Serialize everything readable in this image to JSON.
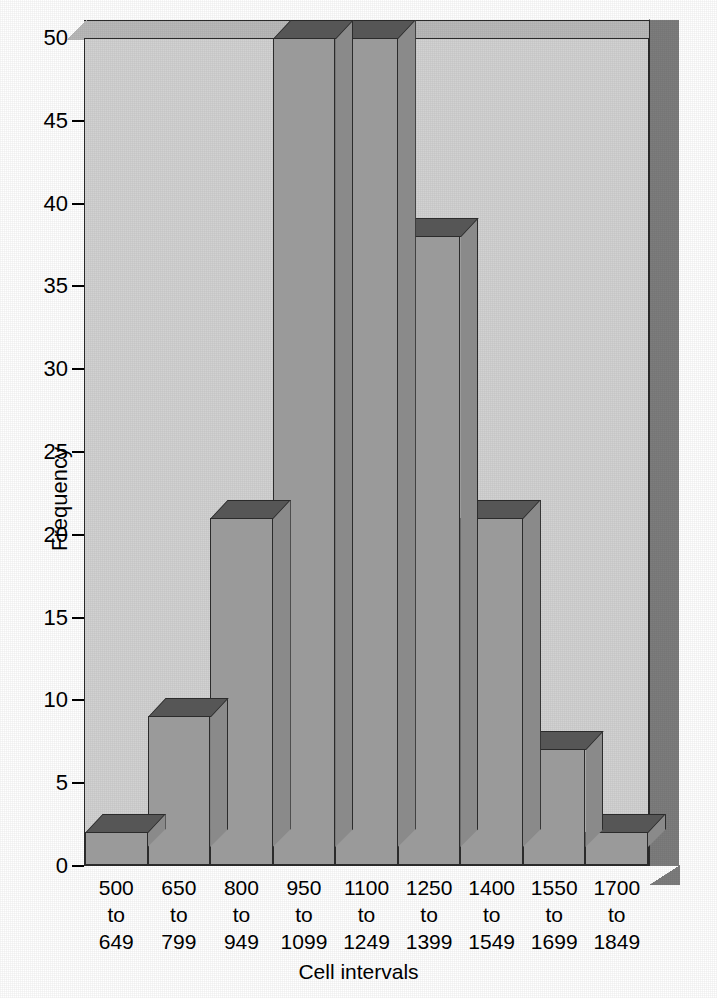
{
  "chart_data": {
    "type": "bar",
    "title": "",
    "xlabel": "Cell intervals",
    "ylabel": "Frequency",
    "categories": [
      "500\nto\n649",
      "650\nto\n799",
      "800\nto\n949",
      "950\nto\n1099",
      "1100\nto\n1249",
      "1250\nto\n1399",
      "1400\nto\n1549",
      "1550\nto\n1699",
      "1700\nto\n1849"
    ],
    "category_lines": [
      [
        "500",
        "to",
        "649"
      ],
      [
        "650",
        "to",
        "799"
      ],
      [
        "800",
        "to",
        "949"
      ],
      [
        "950",
        "to",
        "1099"
      ],
      [
        "1100",
        "to",
        "1249"
      ],
      [
        "1250",
        "to",
        "1399"
      ],
      [
        "1400",
        "to",
        "1549"
      ],
      [
        "1550",
        "to",
        "1699"
      ],
      [
        "1700",
        "to",
        "1849"
      ]
    ],
    "values": [
      2,
      9,
      21,
      50,
      50,
      38,
      21,
      7,
      2
    ],
    "ylim": [
      0,
      50
    ],
    "yticks": [
      0,
      5,
      10,
      15,
      20,
      25,
      30,
      35,
      40,
      45,
      50
    ],
    "ytick_labels": [
      "0",
      "5",
      "10",
      "15",
      "20",
      "25",
      "30",
      "35",
      "40",
      "45",
      "50"
    ],
    "grid": false,
    "legend": null,
    "style": "3d-histogram",
    "colors": {
      "plot_background": "#d2d2d2",
      "bar_front": "#9a9a9a",
      "bar_side": "#8a8a8a",
      "bar_top": "#565656",
      "wall_right": "#7d7d7d",
      "wall_top": "#b9b9b9",
      "outline": "#2b2b2b",
      "text": "#000000",
      "page_background": "#ffffff"
    }
  }
}
